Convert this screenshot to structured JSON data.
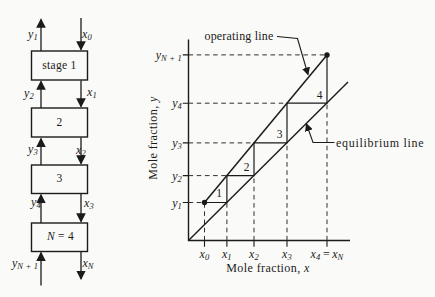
{
  "palette": {
    "ink": "#1b1b1b",
    "paper": "#fafaf8",
    "dash": "#2f2f2f"
  },
  "cascade": {
    "stages": [
      {
        "box_italic": "",
        "box_text": "stage 1",
        "vapor_out": {
          "b": "y",
          "s": "1"
        },
        "liquid_in": {
          "b": "x",
          "s": "0"
        }
      },
      {
        "box_italic": "",
        "box_text": "2",
        "vapor_out": {
          "b": "y",
          "s": "2"
        },
        "liquid_in": {
          "b": "x",
          "s": "1"
        }
      },
      {
        "box_italic": "",
        "box_text": "3",
        "vapor_out": {
          "b": "y",
          "s": "3"
        },
        "liquid_in": {
          "b": "x",
          "s": "2"
        }
      },
      {
        "box_italic": "N",
        "box_text": " = 4",
        "vapor_out": {
          "b": "y",
          "s": "4"
        },
        "liquid_in": {
          "b": "x",
          "s": "3"
        }
      }
    ],
    "vapor_in_bottom": {
      "b": "y",
      "s": "N + 1"
    },
    "liquid_out_bottom": {
      "b": "x",
      "s": "N"
    }
  },
  "plot": {
    "y_axis_title": {
      "text": "Mole fraction, ",
      "var": "y"
    },
    "x_axis_title": {
      "text": "Mole fraction, ",
      "var": "x"
    },
    "operating_line_label": "operating line",
    "equilibrium_line_label": "equilibrium line",
    "stage_numbers": [
      "1",
      "2",
      "3",
      "4"
    ],
    "y_ticks": [
      {
        "b": "y",
        "s": "1"
      },
      {
        "b": "y",
        "s": "2"
      },
      {
        "b": "y",
        "s": "3"
      },
      {
        "b": "y",
        "s": "4"
      },
      {
        "b": "y",
        "s": "N + 1"
      }
    ],
    "x_ticks": [
      {
        "b": "x",
        "s": "0"
      },
      {
        "b": "x",
        "s": "1"
      },
      {
        "b": "x",
        "s": "2"
      },
      {
        "b": "x",
        "s": "3"
      }
    ],
    "x_tick_last": {
      "b1": "x",
      "s1": "4",
      "eq": "=",
      "b2": "x",
      "s2": "N"
    }
  }
}
